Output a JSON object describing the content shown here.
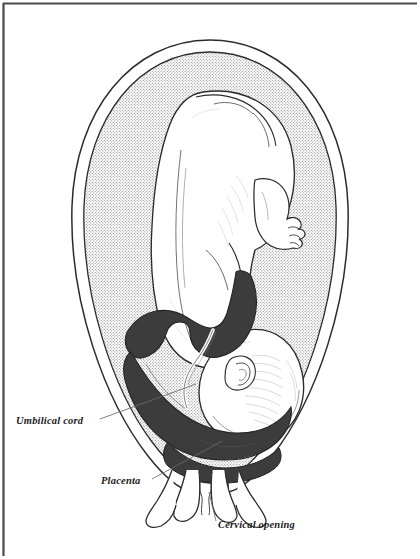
{
  "figure": {
    "background_color": "#ffffff",
    "frame": {
      "color": "#404040",
      "present_sides": [
        "top",
        "left",
        "bottom-left"
      ]
    },
    "colors": {
      "outline": "#2b2b2b",
      "placenta_fill": "#3c3c3c",
      "amniotic_fluid_stipple": "#8a8a8a",
      "fetus_fill": "#ffffff",
      "leader_line": "#6b6b6b",
      "label_text": "#1a1a1a",
      "uterine_wall_fill": "#ffffff"
    },
    "labels": [
      {
        "id": "umbilical-cord",
        "text": "Umbilical cord",
        "x": 16,
        "y": 424,
        "leader": {
          "x1": 100,
          "y1": 419,
          "x2": 196,
          "y2": 384
        }
      },
      {
        "id": "placenta",
        "text": "Placenta",
        "x": 101,
        "y": 484,
        "leader": {
          "x1": 152,
          "y1": 479,
          "x2": 222,
          "y2": 441
        }
      },
      {
        "id": "cervical-opening",
        "text": "Cervical opening",
        "x": 218,
        "y": 528,
        "leader": {
          "x1": 216,
          "y1": 521,
          "x2": 209,
          "y2": 492
        }
      }
    ],
    "anatomy": [
      {
        "id": "uterus-outer-wall",
        "name": "Uterine outer wall"
      },
      {
        "id": "uterus-inner-wall",
        "name": "Uterine inner wall"
      },
      {
        "id": "amniotic-cavity",
        "name": "Amniotic cavity (stippled)"
      },
      {
        "id": "fetus-body",
        "name": "Fetus body, flexed spine"
      },
      {
        "id": "fetus-head",
        "name": "Fetal head, vertex presentation"
      },
      {
        "id": "fetus-ear",
        "name": "Fetal ear"
      },
      {
        "id": "fetus-foot",
        "name": "Fetal foot with toes"
      },
      {
        "id": "placenta-mass",
        "name": "Placenta overlying internal os"
      },
      {
        "id": "umbilical-cord-strand",
        "name": "Umbilical cord"
      },
      {
        "id": "cervix",
        "name": "Cervix and cervical canal"
      }
    ]
  }
}
